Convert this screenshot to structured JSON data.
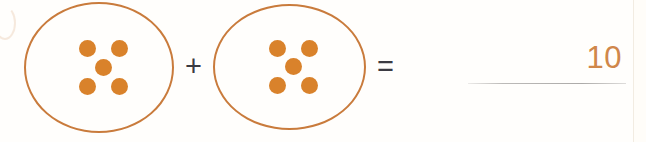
{
  "problem": {
    "type": "addition-with-counters",
    "equation_text": "5 + 5 = 10",
    "plus_symbol": "+",
    "equals_symbol": "=",
    "answer_value": "10",
    "answer_placeholder": "",
    "groups": [
      {
        "id": "group-1",
        "label": "first-addend-group",
        "count": 5,
        "arrangement": "quincunx",
        "dots": [
          {
            "position": "top-left"
          },
          {
            "position": "top-right"
          },
          {
            "position": "center"
          },
          {
            "position": "bottom-left"
          },
          {
            "position": "bottom-right"
          }
        ]
      },
      {
        "id": "group-2",
        "label": "second-addend-group",
        "count": 5,
        "arrangement": "quincunx",
        "dots": [
          {
            "position": "top-left"
          },
          {
            "position": "top-right"
          },
          {
            "position": "center"
          },
          {
            "position": "bottom-left"
          },
          {
            "position": "bottom-right"
          }
        ]
      }
    ]
  },
  "colors": {
    "ellipse_stroke": "#c97b3c",
    "counter_fill": "#d9822b",
    "operator": "#3b3b42",
    "answer_text": "#d0874a",
    "answer_line": "#a8a6a4",
    "background": "#fffefc",
    "page_edge": "#f2ece2"
  }
}
